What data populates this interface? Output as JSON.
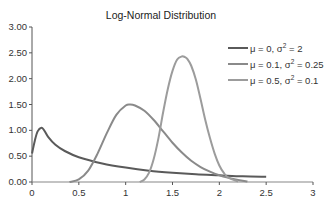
{
  "chart_data": {
    "type": "line",
    "title": "Log-Normal Distribution",
    "xlabel": "",
    "ylabel": "",
    "xlim": [
      0,
      3
    ],
    "ylim": [
      0,
      3
    ],
    "x_ticks": [
      "0",
      "0.5",
      "1",
      "1.5",
      "2",
      "2.5",
      "3"
    ],
    "y_ticks": [
      "0.00",
      "0.50",
      "1.00",
      "1.50",
      "2.00",
      "2.50",
      "3.00"
    ],
    "grid": false,
    "legend_position": "upper right",
    "series": [
      {
        "name": "μ = 0, σ² = 2",
        "label_mu": "μ = 0, σ",
        "label_sq": "2",
        "label_val": " = 2",
        "color": "#5a5a5a",
        "x": [
          0.0,
          0.03,
          0.06,
          0.1,
          0.13,
          0.17,
          0.25,
          0.35,
          0.5,
          0.75,
          1.0,
          1.25,
          1.5,
          1.75,
          2.0,
          2.25,
          2.5
        ],
        "y": [
          0.55,
          0.8,
          0.98,
          1.05,
          1.0,
          0.88,
          0.72,
          0.6,
          0.48,
          0.36,
          0.28,
          0.22,
          0.18,
          0.15,
          0.13,
          0.11,
          0.1
        ]
      },
      {
        "name": "μ = 0.1, σ² = 0.25",
        "label_mu": "μ = 0.1, σ",
        "label_sq": "2",
        "label_val": " = 0.25",
        "color": "#8a8a8a",
        "x": [
          0.4,
          0.5,
          0.6,
          0.7,
          0.8,
          0.9,
          1.0,
          1.05,
          1.1,
          1.2,
          1.3,
          1.4,
          1.5,
          1.6,
          1.7,
          1.8,
          1.9,
          2.0,
          2.1,
          2.2,
          2.3
        ],
        "y": [
          0.0,
          0.05,
          0.22,
          0.55,
          0.95,
          1.3,
          1.48,
          1.5,
          1.48,
          1.38,
          1.2,
          0.98,
          0.76,
          0.57,
          0.41,
          0.29,
          0.2,
          0.13,
          0.08,
          0.04,
          0.01
        ]
      },
      {
        "name": "μ = 0.5, σ² = 0.1",
        "label_mu": "μ = 0.5, σ",
        "label_sq": "2",
        "label_val": " = 0.1",
        "color": "#9c9c9c",
        "x": [
          1.15,
          1.2,
          1.25,
          1.3,
          1.35,
          1.4,
          1.45,
          1.5,
          1.55,
          1.6,
          1.63,
          1.66,
          1.7,
          1.75,
          1.8,
          1.85,
          1.9,
          1.95,
          2.0,
          2.05,
          2.1,
          2.2
        ],
        "y": [
          0.0,
          0.05,
          0.18,
          0.45,
          0.85,
          1.35,
          1.8,
          2.15,
          2.37,
          2.43,
          2.42,
          2.38,
          2.25,
          1.98,
          1.6,
          1.2,
          0.85,
          0.55,
          0.32,
          0.17,
          0.08,
          0.01
        ]
      }
    ]
  }
}
